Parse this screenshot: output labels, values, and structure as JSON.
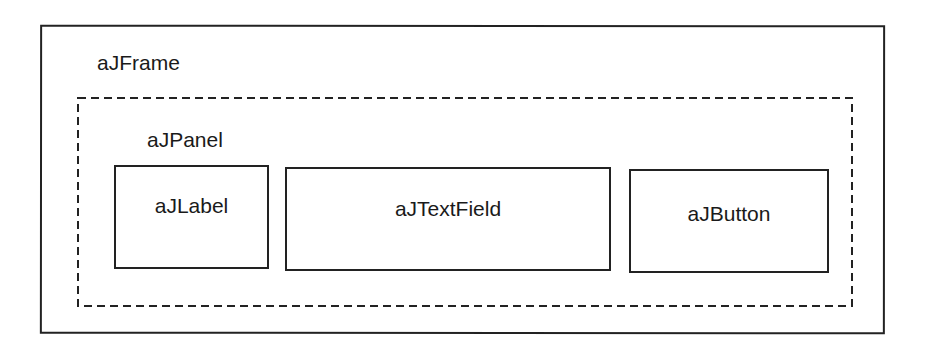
{
  "diagram": {
    "frame": {
      "label": "aJFrame",
      "border_style": "solid"
    },
    "panel": {
      "label": "aJPanel",
      "border_style": "dashed"
    },
    "components": [
      {
        "label": "aJLabel"
      },
      {
        "label": "aJTextField"
      },
      {
        "label": "aJButton"
      }
    ],
    "colors": {
      "stroke": "#222222",
      "background": "#ffffff",
      "text": "#1a1a1a"
    }
  }
}
